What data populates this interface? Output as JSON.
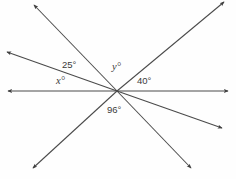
{
  "diagram": {
    "type": "angle-diagram",
    "background_color": "#fefefe",
    "line_color": "#4a4a4a",
    "label_color": "#3a3a3a",
    "vertex": {
      "x": 117,
      "y": 91
    },
    "labels": {
      "angle_25": "25°",
      "angle_x": "x°",
      "angle_y": "y°",
      "angle_40": "40°",
      "angle_96": "96°"
    },
    "rays": [
      {
        "name": "ray-upper-left-steep",
        "end_x": 34,
        "end_y": 5,
        "arrow": true
      },
      {
        "name": "ray-upper-left-shallow",
        "end_x": 7,
        "end_y": 52,
        "arrow": true
      },
      {
        "name": "ray-left-horizontal",
        "end_x": 8,
        "end_y": 91,
        "arrow": true
      },
      {
        "name": "ray-right-horizontal",
        "end_x": 228,
        "end_y": 91,
        "arrow": true
      },
      {
        "name": "ray-upper-right",
        "end_x": 224,
        "end_y": 2,
        "arrow": true
      },
      {
        "name": "ray-lower-right-shallow",
        "end_x": 222,
        "end_y": 128,
        "arrow": true
      },
      {
        "name": "ray-lower-right-steep",
        "end_x": 191,
        "end_y": 168,
        "arrow": true
      },
      {
        "name": "ray-lower-left",
        "end_x": 33,
        "end_y": 168,
        "arrow": true
      }
    ]
  }
}
